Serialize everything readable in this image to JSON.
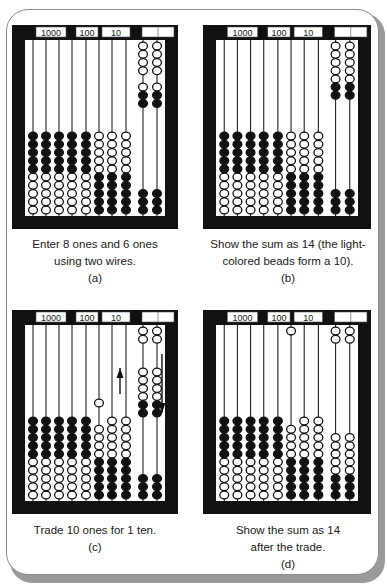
{
  "figure": {
    "place_value_labels": [
      "1000",
      "100",
      "10",
      "1"
    ],
    "panels": [
      {
        "id": "a",
        "caption_lines": [
          "Enter 8 ones and 6 ones",
          "using two wires."
        ],
        "letter": "(a)",
        "wires": [
          {
            "bottom": [
              [
                "w",
                5
              ],
              [
                "b",
                5
              ]
            ],
            "top": []
          },
          {
            "bottom": [
              [
                "w",
                5
              ],
              [
                "b",
                5
              ]
            ],
            "top": []
          },
          {
            "bottom": [
              [
                "w",
                5
              ],
              [
                "b",
                5
              ]
            ],
            "top": []
          },
          {
            "bottom": [
              [
                "w",
                5
              ],
              [
                "b",
                5
              ]
            ],
            "top": []
          },
          {
            "bottom": [
              [
                "w",
                5
              ],
              [
                "b",
                5
              ]
            ],
            "top": []
          },
          {
            "bottom": [
              [
                "b",
                5
              ],
              [
                "w",
                5
              ]
            ],
            "top": []
          },
          {
            "bottom": [
              [
                "b",
                5
              ],
              [
                "w",
                5
              ]
            ],
            "top": []
          },
          {
            "bottom": [
              [
                "b",
                5
              ],
              [
                "w",
                5
              ]
            ],
            "top": []
          },
          {
            "bottom": [
              [
                "b",
                3
              ]
            ],
            "top": [
              [
                "w",
                4
              ]
            ],
            "mid": {
              "offset": 47,
              "beads": [
                [
                  "w",
                  1
                ],
                [
                  "b",
                  2
                ]
              ]
            }
          },
          {
            "bottom": [
              [
                "b",
                3
              ]
            ],
            "top": [
              [
                "w",
                4
              ]
            ],
            "mid": {
              "offset": 47,
              "beads": [
                [
                  "w",
                  1
                ],
                [
                  "b",
                  2
                ]
              ]
            }
          }
        ],
        "arrows": []
      },
      {
        "id": "b",
        "caption_lines": [
          "Show the sum as 14 (the light-",
          "colored beads form a 10)."
        ],
        "letter": "(b)",
        "wires": [
          {
            "bottom": [
              [
                "w",
                5
              ],
              [
                "b",
                5
              ]
            ],
            "top": []
          },
          {
            "bottom": [
              [
                "w",
                5
              ],
              [
                "b",
                5
              ]
            ],
            "top": []
          },
          {
            "bottom": [
              [
                "w",
                5
              ],
              [
                "b",
                5
              ]
            ],
            "top": []
          },
          {
            "bottom": [
              [
                "w",
                5
              ],
              [
                "b",
                5
              ]
            ],
            "top": []
          },
          {
            "bottom": [
              [
                "w",
                5
              ],
              [
                "b",
                5
              ]
            ],
            "top": []
          },
          {
            "bottom": [
              [
                "b",
                5
              ],
              [
                "w",
                5
              ]
            ],
            "top": []
          },
          {
            "bottom": [
              [
                "b",
                5
              ],
              [
                "w",
                5
              ]
            ],
            "top": []
          },
          {
            "bottom": [
              [
                "b",
                5
              ],
              [
                "w",
                5
              ]
            ],
            "top": []
          },
          {
            "bottom": [
              [
                "b",
                3
              ]
            ],
            "top": [
              [
                "w",
                5
              ],
              [
                "b",
                2
              ]
            ]
          },
          {
            "bottom": [
              [
                "b",
                3
              ]
            ],
            "top": [
              [
                "w",
                5
              ],
              [
                "b",
                2
              ]
            ]
          }
        ],
        "arrows": []
      },
      {
        "id": "c",
        "caption_lines": [
          "Trade 10 ones for 1 ten."
        ],
        "letter": "(c)",
        "wires": [
          {
            "bottom": [
              [
                "w",
                5
              ],
              [
                "b",
                5
              ]
            ],
            "top": []
          },
          {
            "bottom": [
              [
                "w",
                5
              ],
              [
                "b",
                5
              ]
            ],
            "top": []
          },
          {
            "bottom": [
              [
                "w",
                5
              ],
              [
                "b",
                5
              ]
            ],
            "top": []
          },
          {
            "bottom": [
              [
                "w",
                5
              ],
              [
                "b",
                5
              ]
            ],
            "top": []
          },
          {
            "bottom": [
              [
                "w",
                5
              ],
              [
                "b",
                5
              ]
            ],
            "top": []
          },
          {
            "bottom": [
              [
                "b",
                5
              ],
              [
                "w",
                4
              ]
            ],
            "top": [],
            "mid": {
              "offset": 78,
              "beads": [
                [
                  "w",
                  1
                ]
              ]
            }
          },
          {
            "bottom": [
              [
                "b",
                5
              ],
              [
                "w",
                5
              ]
            ],
            "top": []
          },
          {
            "bottom": [
              [
                "b",
                5
              ],
              [
                "w",
                5
              ]
            ],
            "top": []
          },
          {
            "bottom": [
              [
                "b",
                3
              ]
            ],
            "top": [
              [
                "w",
                2
              ]
            ],
            "mid": {
              "offset": 47,
              "beads": [
                [
                  "w",
                  4
                ],
                [
                  "b",
                  2
                ]
              ]
            }
          },
          {
            "bottom": [
              [
                "b",
                3
              ]
            ],
            "top": [
              [
                "w",
                2
              ]
            ],
            "mid": {
              "offset": 47,
              "beads": [
                [
                  "w",
                  4
                ],
                [
                  "b",
                  2
                ]
              ]
            }
          }
        ],
        "arrows": [
          {
            "name": "up-arrow",
            "x": 108,
            "y1": 84,
            "y2": 58,
            "dir": "up"
          },
          {
            "name": "down-arrow",
            "x": 150,
            "y1": 44,
            "y2": 103,
            "dir": "down"
          }
        ]
      },
      {
        "id": "d",
        "caption_lines": [
          "Show the sum as 14",
          "after the trade."
        ],
        "letter": "(d)",
        "wires": [
          {
            "bottom": [
              [
                "w",
                5
              ],
              [
                "b",
                5
              ]
            ],
            "top": []
          },
          {
            "bottom": [
              [
                "w",
                5
              ],
              [
                "b",
                5
              ]
            ],
            "top": []
          },
          {
            "bottom": [
              [
                "w",
                5
              ],
              [
                "b",
                5
              ]
            ],
            "top": []
          },
          {
            "bottom": [
              [
                "w",
                5
              ],
              [
                "b",
                5
              ]
            ],
            "top": []
          },
          {
            "bottom": [
              [
                "w",
                5
              ],
              [
                "b",
                5
              ]
            ],
            "top": []
          },
          {
            "bottom": [
              [
                "b",
                5
              ],
              [
                "w",
                4
              ]
            ],
            "top": [
              [
                "w",
                1
              ]
            ]
          },
          {
            "bottom": [
              [
                "b",
                5
              ],
              [
                "w",
                5
              ]
            ],
            "top": []
          },
          {
            "bottom": [
              [
                "b",
                5
              ],
              [
                "w",
                5
              ]
            ],
            "top": []
          },
          {
            "bottom": [
              [
                "b",
                3
              ],
              [
                "w",
                5
              ]
            ],
            "top": [
              [
                "w",
                2
              ]
            ]
          },
          {
            "bottom": [
              [
                "b",
                3
              ],
              [
                "w",
                5
              ]
            ],
            "top": [
              [
                "w",
                2
              ]
            ]
          }
        ],
        "arrows": []
      }
    ]
  },
  "colors": {
    "frame": "#111111",
    "bead_dark": "#111111",
    "bead_light": "#ffffff",
    "wire": "#222222",
    "outer_border": "#8a8a8a"
  }
}
